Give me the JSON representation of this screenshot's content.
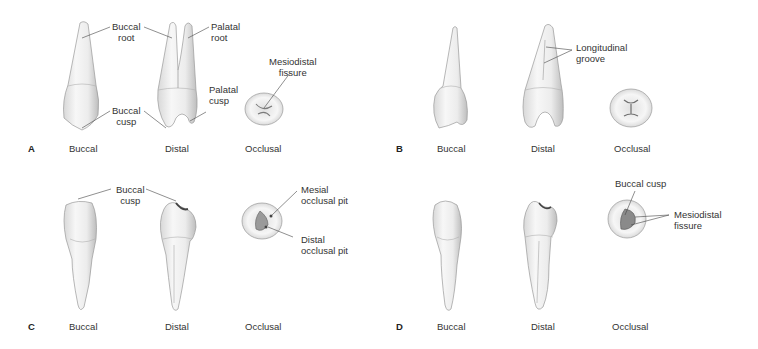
{
  "figure": {
    "panels": [
      {
        "letter": "A",
        "views": [
          "Buccal",
          "Distal",
          "Occlusal"
        ],
        "annotations": {
          "buccal_root": "Buccal\nroot",
          "palatal_root": "Palatal\nroot",
          "mesiodistal_fissure": "Mesiodistal\nfissure",
          "palatal_cusp": "Palatal\ncusp",
          "buccal_cusp": "Buccal\ncusp"
        }
      },
      {
        "letter": "B",
        "views": [
          "Buccal",
          "Distal",
          "Occlusal"
        ],
        "annotations": {
          "longitudinal_groove": "Longitudinal\ngroove"
        }
      },
      {
        "letter": "C",
        "views": [
          "Buccal",
          "Distal",
          "Occlusal"
        ],
        "annotations": {
          "buccal_cusp": "Buccal\ncusp",
          "mesial_occlusal_pit": "Mesial\nocclusal pit",
          "distal_occlusal_pit": "Distal\nocclusal pit"
        }
      },
      {
        "letter": "D",
        "views": [
          "Buccal",
          "Distal",
          "Occlusal"
        ],
        "annotations": {
          "buccal_cusp": "Buccal cusp",
          "mesiodistal_fissure": "Mesiodistal\nfissure"
        }
      }
    ]
  }
}
